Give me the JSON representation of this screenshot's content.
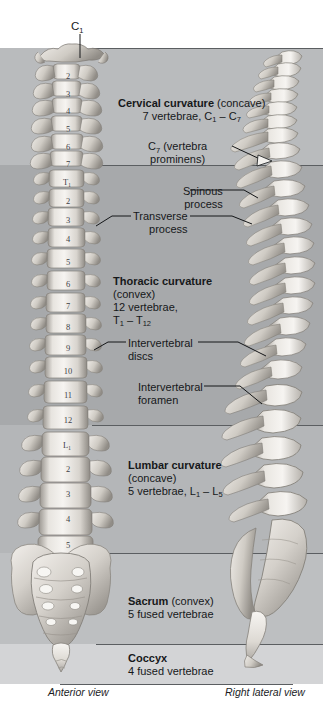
{
  "figure": {
    "view_labels": {
      "anterior": "Anterior view",
      "lateral": "Right lateral view"
    },
    "top_marker": {
      "letter": "C",
      "sub": "1"
    }
  },
  "colors": {
    "band_cervical": "#b9bbbd",
    "band_thoracic": "#a7a9ab",
    "band_lumbar": "#b4b6b8",
    "band_sacrum": "#bdbfc1",
    "band_coccyx": "#d3d4d6",
    "separator": "#5b5e61",
    "leader": "#1a1c1e",
    "bone_light": "#f4f2ef",
    "bone_mid": "#cfccc6",
    "bone_dark": "#8e8a84",
    "text": "#16181a"
  },
  "bands": [
    {
      "id": "cervical",
      "label": "Cervical curvature"
    },
    {
      "id": "thoracic",
      "label": "Thoracic curvature"
    },
    {
      "id": "lumbar",
      "label": "Lumbar curvature"
    },
    {
      "id": "sacrum",
      "label": "Sacrum"
    },
    {
      "id": "coccyx",
      "label": "Coccyx"
    }
  ],
  "labels": {
    "cervical": {
      "name": "Cervical curvature",
      "paren": "(concave)",
      "line2_pre": "7 vertebrae, C",
      "line2_sub1": "1",
      "line2_mid": " – C",
      "line2_sub2": "7"
    },
    "c7": {
      "line1_pre": "C",
      "line1_sub": "7",
      "line1_post": " (vertebra",
      "line2": "prominens)"
    },
    "spinous": {
      "line1": "Spinous",
      "line2": "process"
    },
    "transverse": {
      "line1": "Transverse",
      "line2": "process"
    },
    "thoracic": {
      "name": "Thoracic curvature",
      "paren": "(convex)",
      "line3": "12 vertebrae,",
      "line4_pre": "T",
      "line4_sub1": "1",
      "line4_mid": " – T",
      "line4_sub2": "12"
    },
    "intervertebral_discs": {
      "line1": "Intervertebral",
      "line2": "discs"
    },
    "intervertebral_foramen": {
      "line1": "Intervertebral",
      "line2": "foramen"
    },
    "lumbar": {
      "name": "Lumbar curvature",
      "paren": "(concave)",
      "line3_pre": "5 vertebrae, L",
      "line3_sub1": "1",
      "line3_mid": " – L",
      "line3_sub2": "5"
    },
    "sacrum": {
      "name": "Sacrum",
      "paren": "(convex)",
      "line2": "5 fused vertebrae"
    },
    "coccyx": {
      "name": "Coccyx",
      "line2": "4 fused vertebrae"
    }
  },
  "vertebra_numbers": [
    {
      "text": "2",
      "x": 57,
      "y": 71
    },
    {
      "text": "3",
      "x": 57,
      "y": 89
    },
    {
      "text": "4",
      "x": 57,
      "y": 106
    },
    {
      "text": "5",
      "x": 57,
      "y": 124
    },
    {
      "text": "6",
      "x": 57,
      "y": 142
    },
    {
      "text": "7",
      "x": 57,
      "y": 159
    },
    {
      "text": "T",
      "x": 56,
      "y": 177,
      "sub": "1"
    },
    {
      "text": "2",
      "x": 57,
      "y": 196
    },
    {
      "text": "3",
      "x": 57,
      "y": 215
    },
    {
      "text": "4",
      "x": 57,
      "y": 234
    },
    {
      "text": "5",
      "x": 57,
      "y": 257
    },
    {
      "text": "6",
      "x": 57,
      "y": 279
    },
    {
      "text": "7",
      "x": 57,
      "y": 301
    },
    {
      "text": "8",
      "x": 57,
      "y": 322
    },
    {
      "text": "9",
      "x": 57,
      "y": 343
    },
    {
      "text": "10",
      "x": 57,
      "y": 366
    },
    {
      "text": "11",
      "x": 57,
      "y": 390
    },
    {
      "text": "12",
      "x": 57,
      "y": 415
    },
    {
      "text": "L",
      "x": 56,
      "y": 440,
      "sub": "1"
    },
    {
      "text": "2",
      "x": 57,
      "y": 464
    },
    {
      "text": "3",
      "x": 57,
      "y": 489
    },
    {
      "text": "4",
      "x": 57,
      "y": 514
    },
    {
      "text": "5",
      "x": 57,
      "y": 540
    }
  ]
}
